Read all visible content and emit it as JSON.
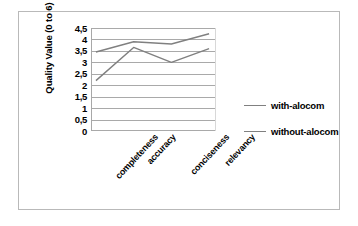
{
  "chart_data": {
    "type": "line",
    "title": "",
    "xlabel": "",
    "ylabel": "Quality Value (0 to 6)",
    "categories": [
      "completeness",
      "accuracy",
      "conciseness",
      "relevancy"
    ],
    "series": [
      {
        "name": "with-alocom",
        "values": [
          3.45,
          3.9,
          3.8,
          4.25
        ],
        "color": "#808080"
      },
      {
        "name": "without-alocom",
        "values": [
          2.2,
          3.65,
          3.0,
          3.6
        ],
        "color": "#808080"
      }
    ],
    "ylim": [
      0,
      4.5
    ],
    "ytick_labels": [
      "4,5",
      "4",
      "3,5",
      "3",
      "2,5",
      "2",
      "1,5",
      "1",
      "0,5",
      "0"
    ],
    "ytick_values": [
      4.5,
      4,
      3.5,
      3,
      2.5,
      2,
      1.5,
      1,
      0.5,
      0
    ],
    "grid": "horizontal",
    "legend_position": "right",
    "markers": "none",
    "border_color": "#b9b9b9",
    "gridline_color": "#a9a9a9",
    "background": "#ffffff"
  }
}
